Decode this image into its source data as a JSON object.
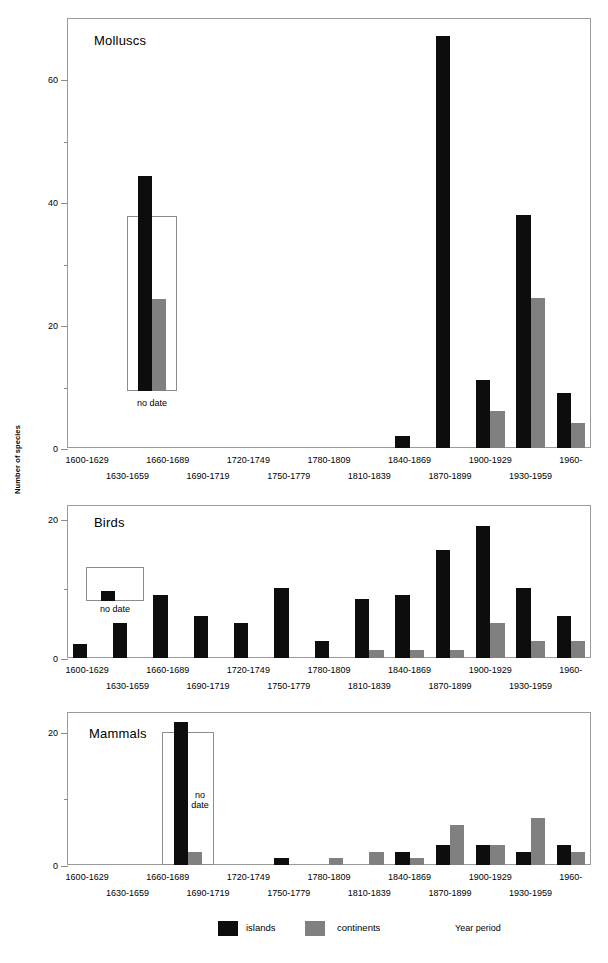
{
  "axis": {
    "y_title": "Number of species",
    "x_title": "Year period"
  },
  "legend": {
    "items": [
      {
        "label": "islands",
        "color": "#0d0d0d"
      },
      {
        "label": "continents",
        "color": "#808080"
      }
    ]
  },
  "categories": [
    "1600-1629",
    "1630-1659",
    "1660-1689",
    "1690-1719",
    "1720-1749",
    "1750-1779",
    "1780-1809",
    "1810-1839",
    "1840-1869",
    "1870-1899",
    "1900-1929",
    "1930-1959",
    "1960-"
  ],
  "no_date_label": "no date",
  "no_date_label_wrapped_line1": "no",
  "no_date_label_wrapped_line2": "date",
  "chart_data": [
    {
      "type": "bar",
      "title": "Molluscs",
      "xlabel": "Year period",
      "ylabel": "Number of species",
      "ylim": [
        0,
        70
      ],
      "yticks": [
        0,
        20,
        40,
        60
      ],
      "yminorticks": [
        10,
        30,
        50
      ],
      "grid": false,
      "legend_position": "bottom",
      "categories": [
        "1600-1629",
        "1630-1659",
        "1660-1689",
        "1690-1719",
        "1720-1749",
        "1750-1779",
        "1780-1809",
        "1810-1839",
        "1840-1869",
        "1870-1899",
        "1900-1929",
        "1930-1959",
        "1960-"
      ],
      "series": [
        {
          "name": "islands",
          "values": [
            0,
            0,
            0,
            0,
            0,
            0,
            0,
            0,
            2,
            67,
            11,
            38,
            9
          ]
        },
        {
          "name": "continents",
          "values": [
            0,
            0,
            0,
            0,
            0,
            0,
            0,
            0,
            0,
            0,
            6,
            24.5,
            4
          ]
        }
      ],
      "no_date": {
        "islands": 35,
        "continents": 15
      }
    },
    {
      "type": "bar",
      "title": "Birds",
      "xlabel": "Year period",
      "ylabel": "Number of species",
      "ylim": [
        0,
        22
      ],
      "yticks": [
        0,
        20
      ],
      "yminorticks": [
        10
      ],
      "grid": false,
      "legend_position": "bottom",
      "categories": [
        "1600-1629",
        "1630-1659",
        "1660-1689",
        "1690-1719",
        "1720-1749",
        "1750-1779",
        "1780-1809",
        "1810-1839",
        "1840-1869",
        "1870-1899",
        "1900-1929",
        "1930-1959",
        "1960-"
      ],
      "series": [
        {
          "name": "islands",
          "values": [
            2,
            5,
            9,
            6,
            5,
            10,
            2.5,
            8.5,
            9,
            15.5,
            19,
            10,
            6
          ]
        },
        {
          "name": "continents",
          "values": [
            0,
            0,
            0,
            0,
            0,
            0,
            0,
            1.2,
            1.2,
            1.2,
            5,
            2.5,
            2.5
          ]
        }
      ],
      "no_date": {
        "islands": 1.5,
        "continents": 0
      }
    },
    {
      "type": "bar",
      "title": "Mammals",
      "xlabel": "Year period",
      "ylabel": "Number of species",
      "ylim": [
        0,
        23
      ],
      "yticks": [
        0,
        20
      ],
      "yminorticks": [
        10
      ],
      "grid": false,
      "legend_position": "bottom",
      "categories": [
        "1600-1629",
        "1630-1659",
        "1660-1689",
        "1690-1719",
        "1720-1749",
        "1750-1779",
        "1780-1809",
        "1810-1839",
        "1840-1869",
        "1870-1899",
        "1900-1929",
        "1930-1959",
        "1960-"
      ],
      "series": [
        {
          "name": "islands",
          "values": [
            0,
            0,
            0,
            0,
            0,
            1,
            0,
            0,
            2,
            3,
            3,
            2,
            3
          ]
        },
        {
          "name": "continents",
          "values": [
            0,
            0,
            0,
            0,
            0,
            0,
            1,
            2,
            1,
            6,
            3,
            7,
            2
          ]
        }
      ],
      "no_date": {
        "islands": 21.5,
        "continents": 2
      }
    }
  ]
}
